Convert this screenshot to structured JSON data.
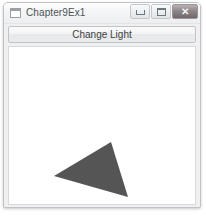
{
  "window": {
    "title": "Chapter9Ex1",
    "icon": "window-document-icon",
    "controls": [
      {
        "name": "minimize",
        "glyph": "–"
      },
      {
        "name": "maximize",
        "glyph": "□"
      },
      {
        "name": "close",
        "glyph": "✕"
      }
    ]
  },
  "toolbar": {
    "change_light_label": "Change Light"
  },
  "canvas": {
    "background_color": "#ffffff",
    "shape": {
      "type": "triangle",
      "fill_color": "#555555",
      "points": "107,118 50,152 124,173",
      "vertices": [
        {
          "x": 107,
          "y": 118
        },
        {
          "x": 50,
          "y": 152
        },
        {
          "x": 124,
          "y": 173
        }
      ]
    }
  }
}
